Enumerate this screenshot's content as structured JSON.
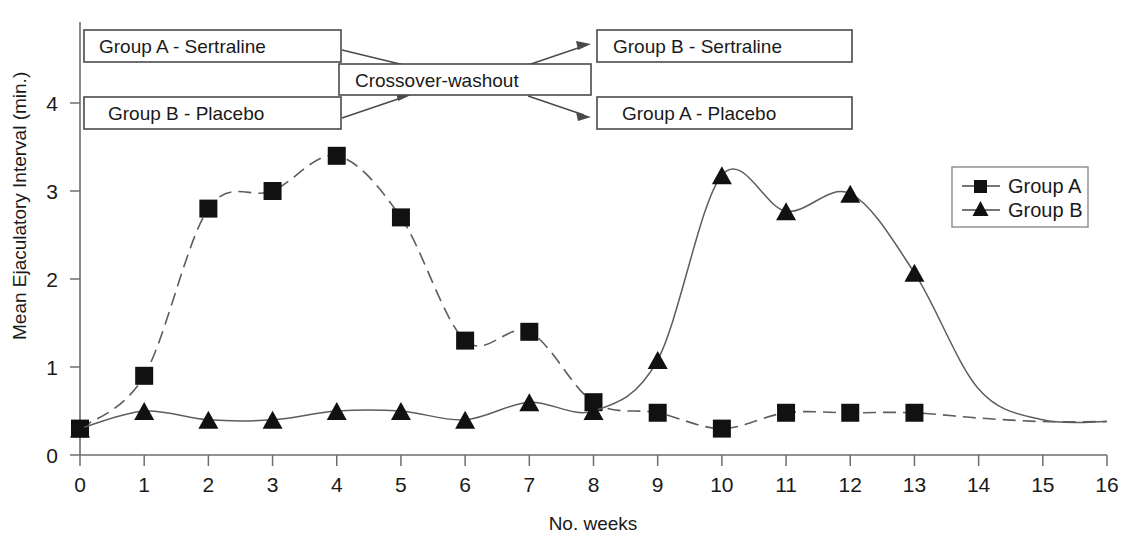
{
  "chart_data": {
    "type": "line",
    "title": "",
    "subtitle": "",
    "xlabel": "No. weeks",
    "ylabel": "Mean Ejaculatory Interval (min.)",
    "x": [
      0,
      1,
      2,
      3,
      4,
      5,
      6,
      7,
      8,
      9,
      10,
      11,
      12,
      13
    ],
    "xlim": [
      0,
      16
    ],
    "ylim": [
      0,
      4.4
    ],
    "xticks": [
      "0",
      "1",
      "2",
      "3",
      "4",
      "5",
      "6",
      "7",
      "8",
      "9",
      "10",
      "11",
      "12",
      "13",
      "14",
      "15",
      "16"
    ],
    "yticks": [
      "0",
      "1",
      "2",
      "3",
      "4"
    ],
    "grid": false,
    "legend_position": "right",
    "series": [
      {
        "name": "Group A",
        "marker": "square",
        "values": [
          0.3,
          0.9,
          2.8,
          3.0,
          3.4,
          2.7,
          1.3,
          1.4,
          0.6,
          0.48,
          0.3,
          0.48,
          0.48,
          0.48
        ],
        "tail_x": [
          14,
          15,
          16
        ],
        "tail_values": [
          0.42,
          0.38,
          0.38
        ]
      },
      {
        "name": "Group B",
        "marker": "triangle",
        "values": [
          0.3,
          0.5,
          0.4,
          0.4,
          0.5,
          0.5,
          0.4,
          0.6,
          0.5,
          1.08,
          3.18,
          2.77,
          2.97,
          2.07
        ],
        "tail_x": [
          14,
          15,
          16
        ],
        "tail_values": [
          0.75,
          0.4,
          0.38
        ]
      }
    ],
    "annotations": [
      {
        "id": "group-a-sertraline",
        "label": "Group A - Sertraline"
      },
      {
        "id": "group-b-placebo",
        "label": "Group B - Placebo"
      },
      {
        "id": "crossover-washout",
        "label": "Crossover-washout"
      },
      {
        "id": "group-b-sertraline",
        "label": "Group B - Sertraline"
      },
      {
        "id": "group-a-placebo",
        "label": "Group A - Placebo"
      }
    ],
    "colors": {
      "line": "#5d5d5d",
      "marker": "#111111",
      "axis": "#6e6e6e",
      "box_border": "#4a4a4a",
      "background": "#ffffff"
    }
  },
  "axis": {
    "x_label": "No. weeks",
    "y_label": "Mean Ejaculatory Interval (min.)",
    "x_ticks": [
      "0",
      "1",
      "2",
      "3",
      "4",
      "5",
      "6",
      "7",
      "8",
      "9",
      "10",
      "11",
      "12",
      "13",
      "14",
      "15",
      "16"
    ],
    "y_ticks": [
      "4",
      "3",
      "2",
      "1",
      "0"
    ]
  },
  "annotations": {
    "group_a_sertraline": "Group A - Sertraline",
    "group_b_placebo": "Group B - Placebo",
    "crossover_washout": "Crossover-washout",
    "group_b_sertraline": "Group B - Sertraline",
    "group_a_placebo": "Group A - Placebo"
  },
  "legend": {
    "items": [
      {
        "label": "Group A",
        "marker": "square-marker"
      },
      {
        "label": "Group B",
        "marker": "triangle-marker"
      }
    ]
  }
}
